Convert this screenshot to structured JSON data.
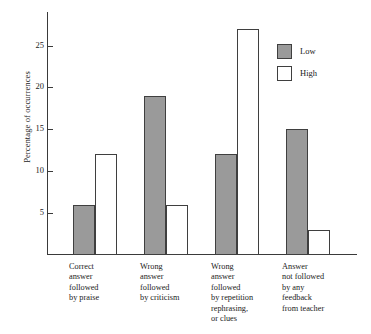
{
  "chart_data": {
    "type": "bar",
    "title": "",
    "xlabel": "",
    "ylabel": "Percentage of occurrences",
    "ylim": [
      0,
      29
    ],
    "yticks": [
      5,
      10,
      15,
      20,
      25
    ],
    "ytick_labels": [
      "5",
      "10",
      "15",
      "20",
      "25"
    ],
    "grid": false,
    "legend_position": "top-right",
    "categories": [
      "Correct\nanswer\nfollowed\nby praise",
      "Wrong\nanswer\nfollowed\nby criticism",
      "Wrong\nanswer\nfollowed\nby repetition\nrephrasing,\nor clues",
      "Answer\nnot followed\nby any\nfeedback\nfrom teacher"
    ],
    "series": [
      {
        "name": "Low",
        "values": [
          6,
          19,
          12,
          15
        ],
        "color": "#9a9a9a"
      },
      {
        "name": "High",
        "values": [
          12,
          6,
          27,
          3
        ],
        "color": "#ffffff"
      }
    ]
  },
  "legend": {
    "items": [
      {
        "label": "Low",
        "swatch": "#9a9a9a"
      },
      {
        "label": "High",
        "swatch": "#ffffff"
      }
    ]
  },
  "axes": {
    "y_label": "Percentage of occurrences"
  }
}
